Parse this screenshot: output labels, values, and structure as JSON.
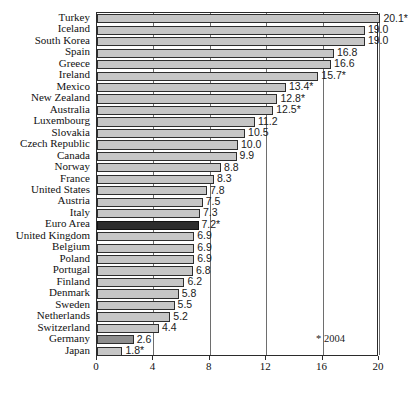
{
  "chart_data": {
    "type": "bar",
    "orientation": "horizontal",
    "title": "",
    "subtitle": "",
    "xlabel": "",
    "ylabel": "",
    "xlim": [
      0,
      20
    ],
    "ylim": null,
    "grid": true,
    "legend_position": "none",
    "xticks": [
      "0",
      "4",
      "8",
      "12",
      "16",
      "20"
    ],
    "xtick_values": [
      0,
      4,
      8,
      12,
      16,
      20
    ],
    "categories": [
      "Turkey",
      "Iceland",
      "South Korea",
      "Spain",
      "Greece",
      "Ireland",
      "Mexico",
      "New Zealand",
      "Australia",
      "Luxembourg",
      "Slovakia",
      "Czech Republic",
      "Canada",
      "Norway",
      "France",
      "United States",
      "Austria",
      "Italy",
      "Euro Area",
      "United Kingdom",
      "Belgium",
      "Poland",
      "Portugal",
      "Finland",
      "Denmark",
      "Sweden",
      "Netherlands",
      "Switzerland",
      "Germany",
      "Japan"
    ],
    "values": [
      20.1,
      19.0,
      19.0,
      16.8,
      16.6,
      15.7,
      13.4,
      12.8,
      12.5,
      11.2,
      10.5,
      10.0,
      9.9,
      8.8,
      8.3,
      7.8,
      7.5,
      7.3,
      7.2,
      6.9,
      6.9,
      6.9,
      6.8,
      6.2,
      5.8,
      5.5,
      5.2,
      4.4,
      2.6,
      1.8
    ],
    "data_labels": [
      "20.1*",
      "19.0",
      "19.0",
      "16.8",
      "16.6",
      "15.7*",
      "13.4*",
      "12.8*",
      "12.5*",
      "11.2",
      "10.5",
      "10.0",
      "9.9",
      "8.8",
      "8.3",
      "7.8",
      "7.5",
      "7.3",
      "7.2*",
      "6.9",
      "6.9",
      "6.9",
      "6.8",
      "6.2",
      "5.8",
      "5.5",
      "5.2",
      "4.4",
      "2.6",
      "1.8*"
    ],
    "bar_styles": [
      "normal",
      "normal",
      "normal",
      "normal",
      "normal",
      "normal",
      "normal",
      "normal",
      "normal",
      "normal",
      "normal",
      "normal",
      "normal",
      "normal",
      "normal",
      "normal",
      "normal",
      "normal",
      "highlight",
      "normal",
      "normal",
      "normal",
      "normal",
      "normal",
      "normal",
      "normal",
      "normal",
      "normal",
      "mid",
      "normal"
    ],
    "annotations": [
      {
        "name": "footnote",
        "text": "* 2004"
      }
    ],
    "colors": {
      "bar_fill": "#c6c6c6",
      "bar_border": "#2e2e2e",
      "highlight_fill": "#2d2d2d",
      "mid_fill": "#8e8e8e",
      "gridline": "#6e6e6e",
      "axis": "#2b2b2b",
      "text": "#111111",
      "background": "#ffffff"
    }
  }
}
